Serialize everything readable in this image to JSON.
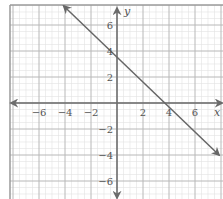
{
  "chart_data": {
    "type": "line",
    "title": "",
    "xlabel": "x",
    "ylabel": "y",
    "xlim": [
      -8.2,
      8.2
    ],
    "ylim": [
      -7.3,
      7.6
    ],
    "grid": true,
    "grid_minor_step": 0.5,
    "grid_major_step": 2,
    "x_ticks": [
      -6,
      -4,
      -2,
      2,
      4,
      6
    ],
    "y_ticks": [
      6,
      4,
      2,
      -2,
      -4,
      -6
    ],
    "x_tick_labels": [
      "−6",
      "−4",
      "−2",
      "2",
      "4",
      "6"
    ],
    "y_tick_labels": [
      "6",
      "4",
      "2",
      "−2",
      "−4",
      "−6"
    ],
    "series": [
      {
        "name": "y = -x + 4",
        "slope": -1,
        "intercept": 4,
        "x": [
          -4,
          0,
          4,
          8
        ],
        "y": [
          8,
          4,
          0,
          -4
        ],
        "arrows": "both",
        "color": "#666666"
      }
    ],
    "legend": null
  },
  "colors": {
    "axis": "#6b6b6b",
    "grid_major": "#b8b8b8",
    "grid_minor": "#e2e2e2",
    "line": "#666666",
    "text": "#555555"
  }
}
